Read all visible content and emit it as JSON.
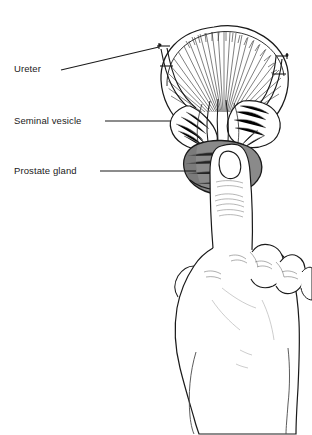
{
  "figure": {
    "background_color": "#ffffff",
    "line_color": "#1a1a1a",
    "prostate_fill_color": "#8a8a8a",
    "label_text_color": "#1a1a1a"
  },
  "labels": [
    {
      "id": "ureter",
      "text": "Ureter",
      "leader": {
        "x1": 61,
        "y1": 70,
        "x2": 159,
        "y2": 47
      }
    },
    {
      "id": "seminal-vesicle",
      "text": "Seminal vesicle",
      "leader": {
        "x1": 105,
        "y1": 121,
        "x2": 171,
        "y2": 121
      }
    },
    {
      "id": "prostate-gland",
      "text": "Prostate gland",
      "leader": {
        "x1": 100,
        "y1": 171,
        "x2": 196,
        "y2": 171
      }
    }
  ],
  "structures": [
    {
      "name": "bladder",
      "description": "Urinary bladder dome with radial muscle hatching"
    },
    {
      "name": "left-ureter",
      "description": "Left ureter entering bladder with clamp marker"
    },
    {
      "name": "right-ureter",
      "description": "Right ureter entering bladder with clamp marker"
    },
    {
      "name": "left-seminal-vesicle",
      "description": "Left lobed seminal vesicle"
    },
    {
      "name": "right-seminal-vesicle",
      "description": "Right lobed seminal vesicle"
    },
    {
      "name": "vas-deferens",
      "description": "Central vas deferens bundle"
    },
    {
      "name": "prostate-gland",
      "description": "Shaded prostate gland inferior to bladder"
    },
    {
      "name": "examining-hand",
      "description": "Clinician hand with index finger extended upward"
    },
    {
      "name": "index-finger",
      "description": "Index finger palpating the prostate gland"
    },
    {
      "name": "fingernail",
      "description": "Fingernail on extended index finger"
    }
  ]
}
